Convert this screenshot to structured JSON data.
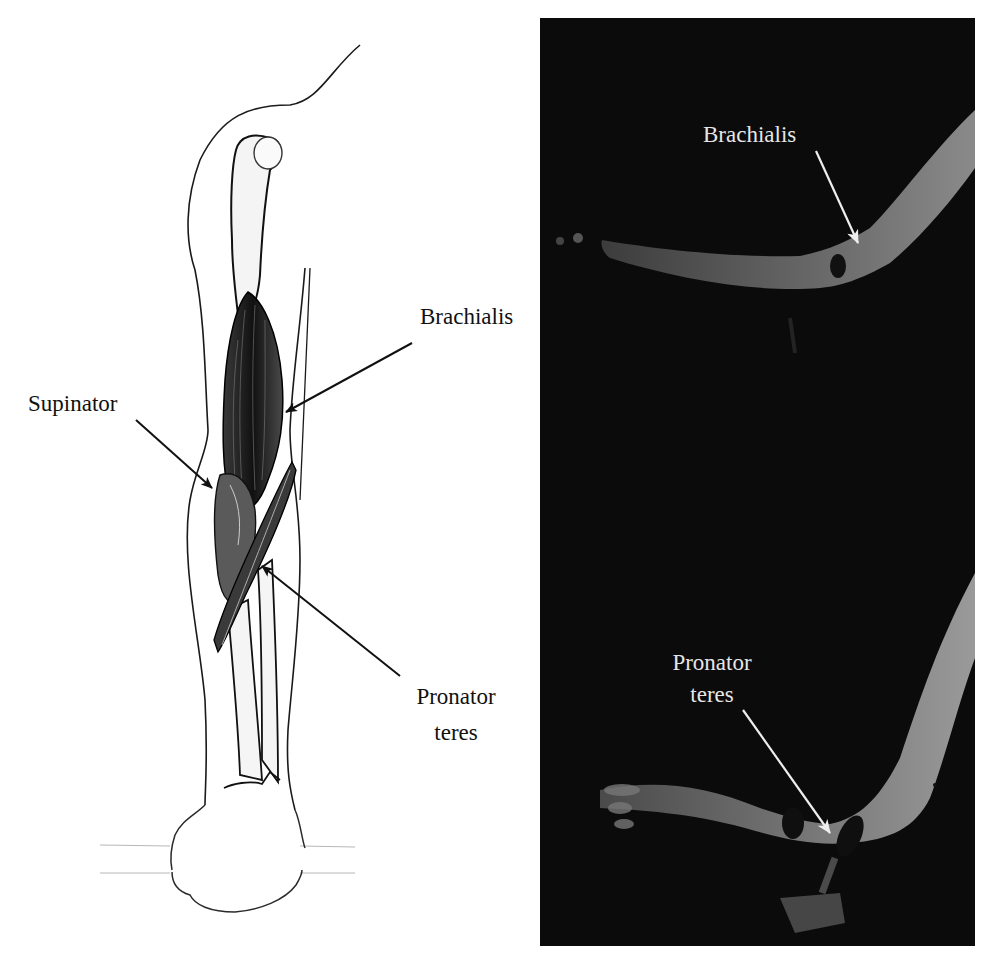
{
  "figure": {
    "drawing_panel": {
      "description": "Line drawing of the right arm showing humerus, radius and ulna with muscles",
      "labels": {
        "brachialis": "Brachialis",
        "supinator": "Supinator",
        "pronator_teres_line1": "Pronator",
        "pronator_teres_line2": "teres"
      }
    },
    "photo_panel": {
      "description": "Two photographs of a flexed arm on dark background",
      "background_color": "#0b0b0b",
      "label_color": "#e6e6e6",
      "top_photo": {
        "label": "Brachialis"
      },
      "bottom_photo": {
        "label_line1": "Pronator",
        "label_line2": "teres"
      }
    }
  }
}
